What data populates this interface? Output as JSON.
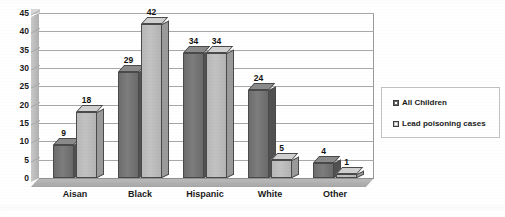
{
  "chart_data": {
    "type": "bar",
    "title": "",
    "subtitle": "",
    "xlabel": "",
    "ylabel": "",
    "categories": [
      "Aisan",
      "Black",
      "Hispanic",
      "White",
      "Other"
    ],
    "series": [
      {
        "name": "All Children",
        "values": [
          9,
          29,
          34,
          24,
          4
        ],
        "color": "#6d6d6d"
      },
      {
        "name": "Lead poisoning cases",
        "values": [
          18,
          42,
          34,
          5,
          1
        ],
        "color": "#b8b8b8"
      }
    ],
    "ylim": [
      0,
      45
    ],
    "ytick_step": 5,
    "yticks": [
      "0",
      "5",
      "10",
      "15",
      "20",
      "25",
      "30",
      "35",
      "40",
      "45"
    ],
    "grid": true,
    "legend_position": "right",
    "data_labels": true,
    "style_3d": true
  },
  "legend": {
    "items": [
      {
        "label": "All Children",
        "swatch": "dark"
      },
      {
        "label": "Lead poisoning cases",
        "swatch": "light"
      }
    ]
  },
  "colors": {
    "series_all_children": "#6d6d6d",
    "series_lead_poisoning": "#b8b8b8",
    "gridline": "#a8a8a8",
    "axis_text": "#1a1a1a",
    "plot_background": "#ffffff",
    "legend_border": "#c2c2c2"
  }
}
